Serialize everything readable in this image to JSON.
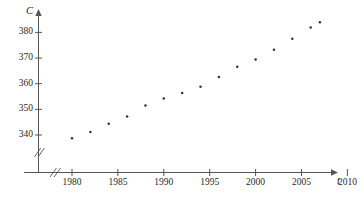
{
  "chart_data": {
    "type": "scatter",
    "title": "",
    "xlabel": "t",
    "ylabel": "C",
    "xlabel_full": "t",
    "ylabel_full": "C",
    "x_ticks": [
      1980,
      1985,
      1990,
      1995,
      2000,
      2005,
      2010
    ],
    "y_ticks": [
      340,
      350,
      360,
      370,
      380
    ],
    "xlim": [
      1977.5,
      2011
    ],
    "ylim": [
      334,
      384.5
    ],
    "grid": false,
    "legend": null,
    "axis_break_x": true,
    "axis_break_y": true,
    "marker": "dot",
    "marker_color": "#333333",
    "axis_color": "#555555",
    "x": [
      1980,
      1982,
      1984,
      1986,
      1988,
      1990,
      1992,
      1994,
      1996,
      1998,
      2000,
      2002,
      2004,
      2006,
      2007
    ],
    "y": [
      338.7,
      341.2,
      344.4,
      347.2,
      351.5,
      354.2,
      356.4,
      358.8,
      362.6,
      366.6,
      369.4,
      373.2,
      377.5,
      381.9,
      384.0
    ],
    "points": [
      {
        "x": 1980,
        "y": 338.7
      },
      {
        "x": 1982,
        "y": 341.2
      },
      {
        "x": 1984,
        "y": 344.4
      },
      {
        "x": 1986,
        "y": 347.2
      },
      {
        "x": 1988,
        "y": 351.5
      },
      {
        "x": 1990,
        "y": 354.2
      },
      {
        "x": 1992,
        "y": 356.4
      },
      {
        "x": 1994,
        "y": 358.8
      },
      {
        "x": 1996,
        "y": 362.6
      },
      {
        "x": 1998,
        "y": 366.6
      },
      {
        "x": 2000,
        "y": 369.4
      },
      {
        "x": 2002,
        "y": 373.2
      },
      {
        "x": 2004,
        "y": 377.5
      },
      {
        "x": 2006,
        "y": 381.9
      },
      {
        "x": 2007,
        "y": 384.0
      }
    ]
  },
  "axis": {
    "y_name": "C",
    "x_name": "t"
  },
  "y_tick_labels": [
    "340",
    "350",
    "360",
    "370",
    "380"
  ],
  "x_tick_labels": [
    "1980",
    "1985",
    "1990",
    "1995",
    "2000",
    "2005",
    "2010"
  ]
}
